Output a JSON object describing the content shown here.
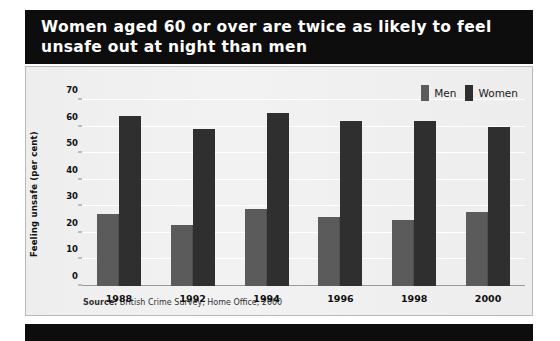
{
  "title": {
    "text": "Women aged 60 or over are twice as likely to feel unsafe out at night than men"
  },
  "source": {
    "prefix": "Source:",
    "text": " British Crime Survey, Home Office, 2000"
  },
  "legend": {
    "items": [
      {
        "label": "Men",
        "color": "#5b5b5b"
      },
      {
        "label": "Women",
        "color": "#2f2f2f"
      }
    ]
  },
  "colors": {
    "men": "#5b5b5b",
    "women": "#2f2f2f",
    "banner": "#0d0d0d",
    "panel": "#f0f0f0",
    "gridline": "#ffffff"
  },
  "chart_data": {
    "type": "bar",
    "title": "Women aged 60 or over are twice as likely to feel unsafe out at night than men",
    "xlabel": "",
    "ylabel": "Feeling unsafe (per cent)",
    "categories": [
      "1988",
      "1992",
      "1994",
      "1996",
      "1998",
      "2000"
    ],
    "series": [
      {
        "name": "Men",
        "values": [
          27,
          23,
          29,
          26,
          25,
          28
        ]
      },
      {
        "name": "Women",
        "values": [
          64,
          59,
          65,
          62,
          62,
          60
        ]
      }
    ],
    "ylim": [
      0,
      70
    ],
    "yticks": [
      0,
      10,
      20,
      30,
      40,
      50,
      60,
      70
    ],
    "ytick_labels": [
      "0",
      "10",
      "20",
      "30",
      "40",
      "50",
      "60",
      "70"
    ],
    "grid": true,
    "legend_position": "top-right",
    "source": "Source: British Crime Survey, Home Office, 2000"
  }
}
